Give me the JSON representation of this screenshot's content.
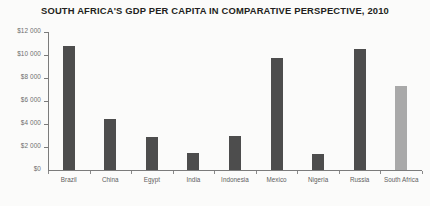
{
  "chart_data": {
    "type": "bar",
    "title": "SOUTH AFRICA'S GDP PER CAPITA IN COMPARATIVE PERSPECTIVE, 2010",
    "xlabel": "",
    "ylabel": "",
    "ylim": [
      0,
      12000
    ],
    "grid": false,
    "legend": null,
    "categories": [
      "Brazil",
      "China",
      "Egypt",
      "India",
      "Indonesia",
      "Mexico",
      "Nigeria",
      "Russia",
      "South Africa"
    ],
    "values": [
      10800,
      4400,
      2900,
      1500,
      3000,
      9700,
      1400,
      10500,
      7300
    ],
    "y_tick_labels": [
      "$12 000",
      "$10 000",
      "$8 000",
      "$6 000",
      "$4 000",
      "$2 000",
      "$0"
    ],
    "y_tick_values": [
      12000,
      10000,
      8000,
      6000,
      4000,
      2000,
      0
    ],
    "bar_colors": [
      "#4d4d4d",
      "#4d4d4d",
      "#4d4d4d",
      "#4d4d4d",
      "#4d4d4d",
      "#4d4d4d",
      "#4d4d4d",
      "#4d4d4d",
      "#a9a9a9"
    ],
    "highlight_category": "South Africa",
    "highlight_color": "#a9a9a9",
    "default_bar_color": "#4d4d4d",
    "axis_color": "#7b7b7b",
    "background_color": "#fbfbfa"
  }
}
